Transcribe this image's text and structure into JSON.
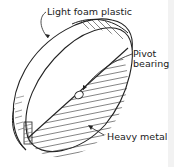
{
  "diagram": {
    "labels": {
      "top_material": "Light foam plastic",
      "pivot_line1": "Pivot",
      "pivot_line2": "bearing",
      "bottom_material": "Heavy metal"
    },
    "colors": {
      "line": "#222222",
      "background": "#ffffff"
    }
  }
}
